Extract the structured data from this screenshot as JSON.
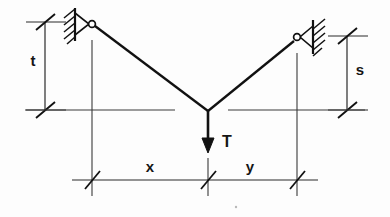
{
  "figure": {
    "kind": "engineering-statics-free-body-diagram",
    "background_color": "#fdfdfd",
    "ink_color": "#1a1a1a"
  },
  "labels": {
    "t": "t",
    "s": "s",
    "x": "x",
    "y": "y",
    "T": "T"
  },
  "dimensions": {
    "vertical_left": {
      "name": "t",
      "label": "t",
      "meaning": "vertical drop from left support to junction level",
      "tick_top_y": 22,
      "tick_bottom_y": 110,
      "line_x": 45
    },
    "vertical_right": {
      "name": "s",
      "label": "s",
      "meaning": "vertical drop from right support to junction level",
      "tick_top_y": 36,
      "tick_bottom_y": 110,
      "line_x": 347
    },
    "horizontal_left": {
      "name": "x",
      "label": "x",
      "meaning": "horizontal distance from left support to junction",
      "tick_left_x": 92,
      "tick_right_x": 208,
      "line_y": 180
    },
    "horizontal_right": {
      "name": "y",
      "label": "y",
      "meaning": "horizontal distance from junction to right support",
      "tick_left_x": 208,
      "tick_right_x": 297,
      "line_y": 180
    }
  },
  "supports": {
    "left": {
      "name": "pin-support-left",
      "pin_cx": 92,
      "pin_cy": 24,
      "wall_x": 75,
      "wall_top_y": 8,
      "wall_bottom_y": 41,
      "hatch_count": 5,
      "hatch_direction": "up-right"
    },
    "right": {
      "name": "pin-support-right",
      "pin_cx": 297,
      "pin_cy": 37,
      "wall_x": 313,
      "wall_top_y": 20,
      "wall_bottom_y": 54,
      "hatch_count": 5,
      "hatch_direction": "up-right"
    }
  },
  "members": {
    "left_cable": {
      "name": "cable-left",
      "from": [
        95,
        26
      ],
      "to": [
        208,
        110
      ]
    },
    "right_cable": {
      "name": "cable-right",
      "from": [
        208,
        110
      ],
      "to": [
        295,
        40
      ]
    }
  },
  "load": {
    "name": "load-arrow-T",
    "label": "T",
    "direction": "down",
    "apex": [
      208,
      110
    ],
    "tip_y": 152
  },
  "reference_lines": {
    "junction_level_y": 110,
    "left_ref_from_x": 25,
    "left_ref_to_x": 175,
    "right_ref_from_x": 228,
    "right_ref_to_x": 365,
    "extension_left_x": 92,
    "extension_right_x": 297,
    "extension_center_x": 208,
    "extension_top_y": 40,
    "extension_bottom_y": 196
  }
}
